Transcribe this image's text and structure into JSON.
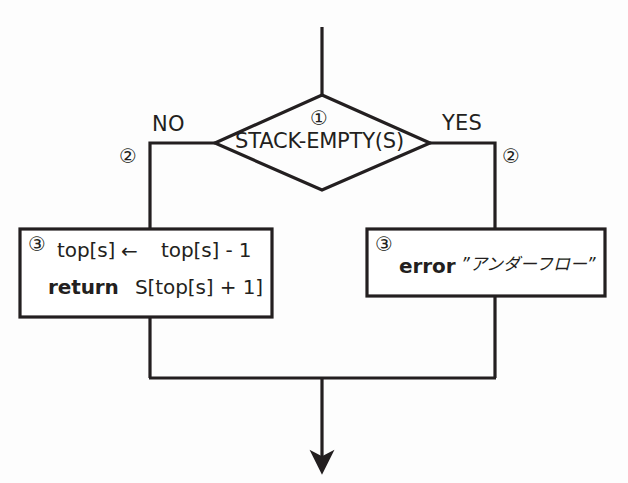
{
  "diagram": {
    "type": "flowchart",
    "decision": {
      "step_marker": "①",
      "condition": "STACK-EMPTY(S)"
    },
    "branches": {
      "no": {
        "label": "NO",
        "step_marker": "②"
      },
      "yes": {
        "label": "YES",
        "step_marker": "②"
      }
    },
    "process_left": {
      "step_marker": "③",
      "line1_lhs": "top[s]",
      "line1_arrow": "←",
      "line1_rhs": "top[s] - 1",
      "line2_keyword": "return",
      "line2_expr": "S[top[s] + 1]"
    },
    "process_right": {
      "step_marker": "③",
      "keyword": "error",
      "message": "”アンダーフロー”"
    },
    "colors": {
      "stroke": "#231f20",
      "text": "#231f20",
      "background": "#fdfdfd"
    }
  }
}
